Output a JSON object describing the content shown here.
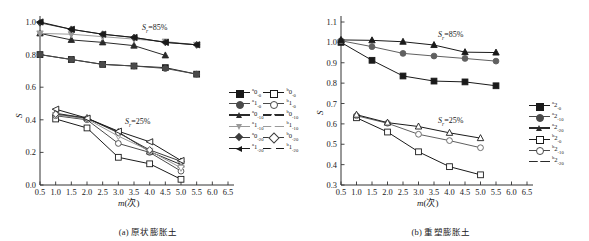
{
  "figure": {
    "panels": [
      {
        "id": "a",
        "caption": "(a) 原状膨胀土",
        "xlabel": "m(次)",
        "ylabel": "S",
        "annotations": [
          {
            "name": "sr-85-label",
            "text": "S",
            "sub": "r",
            "rest": "=85%"
          },
          {
            "name": "sr-25-label",
            "text": "S",
            "sub": "r",
            "rest": "=25%"
          }
        ]
      },
      {
        "id": "b",
        "caption": "(b) 重塑膨胀土",
        "xlabel": "m(次)",
        "ylabel": "S",
        "annotations": [
          {
            "name": "sr-85-label",
            "text": "S",
            "sub": "r",
            "rest": "=85%"
          },
          {
            "name": "sr-25-label",
            "text": "S",
            "sub": "r",
            "rest": "=25%"
          }
        ]
      }
    ]
  },
  "chart_data": [
    {
      "type": "line",
      "panel": "a",
      "title": "(a) 原状膨胀土",
      "xlabel": "m(次)",
      "ylabel": "S",
      "xlim": [
        0.5,
        6.5
      ],
      "ylim": [
        0.0,
        1.0
      ],
      "xticks": [
        0.5,
        1.0,
        1.5,
        2.0,
        2.5,
        3.0,
        3.5,
        4.0,
        4.5,
        5.0,
        5.5,
        6.0,
        6.5
      ],
      "yticks": [
        0.0,
        0.2,
        0.4,
        0.6,
        0.8,
        1.0
      ],
      "xtick_labels": [
        "0.5",
        "1.0",
        "1.5",
        "2.0",
        "2.5",
        "3.0",
        "3.5",
        "4.0",
        "4.5",
        "5.0",
        "5.5",
        "6.0",
        "6.5"
      ],
      "ytick_labels": [
        "0.0",
        "0.2",
        "0.4",
        "0.6",
        "0.8",
        "1.0"
      ],
      "grid": false,
      "legend_position": "right",
      "groups": [
        {
          "name": "Sr=85%",
          "label_sub": "r",
          "value": "85%"
        },
        {
          "name": "Sr=25%",
          "label_sub": "r",
          "value": "25%"
        }
      ],
      "series": [
        {
          "name": "a0-0",
          "sup": "a",
          "base": "0",
          "sub": "-0",
          "group": "Sr=85%",
          "marker": "square-filled",
          "color": "#1a1a1a",
          "x": [
            0.5,
            1.5,
            2.5,
            3.5,
            4.5,
            5.5
          ],
          "y": [
            0.8,
            0.77,
            0.74,
            0.73,
            0.72,
            0.68
          ]
        },
        {
          "name": "a1-0",
          "sup": "a",
          "base": "1",
          "sub": "-0",
          "group": "Sr=85%",
          "marker": "circle-filled",
          "color": "#4a4a4a",
          "x": [
            0.5,
            1.5,
            2.5,
            3.5,
            4.5,
            5.5
          ],
          "y": [
            0.8,
            0.77,
            0.74,
            0.73,
            0.715,
            0.68
          ]
        },
        {
          "name": "a0-10",
          "sup": "a",
          "base": "0",
          "sub": "-10",
          "group": "Sr=85%",
          "marker": "triangle-filled",
          "color": "#2a2a2a",
          "x": [
            0.5,
            1.5,
            2.5,
            3.5,
            4.5
          ],
          "y": [
            0.93,
            0.89,
            0.875,
            0.855,
            0.795
          ]
        },
        {
          "name": "a1-10",
          "sup": "a",
          "base": "1",
          "sub": "-10",
          "group": "Sr=85%",
          "marker": "triangle-down",
          "color": "#9a9a9a",
          "x": [
            0.5,
            1.5,
            2.5,
            3.5,
            4.5,
            5.5
          ],
          "y": [
            0.93,
            0.925,
            0.91,
            0.895,
            0.88,
            0.86
          ]
        },
        {
          "name": "a0-20",
          "sup": "a",
          "base": "0",
          "sub": "-20",
          "group": "Sr=85%",
          "marker": "diamond-filled",
          "color": "#3c3c3c",
          "x": [
            0.5,
            1.5,
            2.5,
            3.5,
            4.5,
            5.5
          ],
          "y": [
            0.995,
            0.955,
            0.925,
            0.905,
            0.875,
            0.86
          ]
        },
        {
          "name": "a1-20",
          "sup": "a",
          "base": "1",
          "sub": "-20",
          "group": "Sr=85%",
          "marker": "left-triangle-filled",
          "color": "#1a1a1a",
          "x": [
            0.5,
            1.5,
            2.5,
            3.5,
            4.5,
            5.5
          ],
          "y": [
            1.0,
            0.955,
            0.925,
            0.905,
            0.875,
            0.86
          ]
        },
        {
          "name": "b0-0",
          "sup": "b",
          "base": "0",
          "sub": "-0",
          "group": "Sr=25%",
          "marker": "square-open",
          "color": "#1a1a1a",
          "x": [
            1.0,
            2.0,
            3.0,
            4.0,
            5.0
          ],
          "y": [
            0.405,
            0.35,
            0.17,
            0.13,
            0.035
          ]
        },
        {
          "name": "b1-0",
          "sup": "b",
          "base": "1",
          "sub": "-0",
          "group": "Sr=25%",
          "marker": "circle-open",
          "color": "#4a4a4a",
          "x": [
            1.0,
            2.0,
            3.0,
            4.0,
            5.0
          ],
          "y": [
            0.425,
            0.4,
            0.255,
            0.2,
            0.085
          ]
        },
        {
          "name": "b0-10",
          "sup": "b",
          "base": "0",
          "sub": "-10",
          "group": "Sr=25%",
          "marker": "triangle-open",
          "color": "#2a2a2a",
          "x": [
            1.0,
            2.0,
            3.0,
            4.0,
            5.0
          ],
          "y": [
            0.44,
            0.41,
            0.325,
            0.205,
            0.125
          ]
        },
        {
          "name": "b1-10",
          "sup": "b",
          "base": "1",
          "sub": "-10",
          "group": "Sr=25%",
          "marker": "triangle-down-open",
          "color": "#9a9a9a",
          "x": [
            1.0,
            2.0,
            3.0,
            4.0,
            5.0
          ],
          "y": [
            0.43,
            0.405,
            0.3,
            0.21,
            0.105
          ]
        },
        {
          "name": "b0-20",
          "sup": "b",
          "base": "0",
          "sub": "-20",
          "group": "Sr=25%",
          "marker": "diamond-open",
          "color": "#3c3c3c",
          "x": [
            1.0,
            2.0,
            3.0,
            4.0,
            5.0
          ],
          "y": [
            0.435,
            0.41,
            0.32,
            0.215,
            0.145
          ]
        },
        {
          "name": "b1-20",
          "sup": "b",
          "base": "1",
          "sub": "-20",
          "group": "Sr=25%",
          "marker": "left-triangle-open",
          "color": "#1a1a1a",
          "x": [
            1.0,
            2.0,
            3.0,
            4.0,
            5.0
          ],
          "y": [
            0.465,
            0.41,
            0.33,
            0.265,
            0.15
          ]
        }
      ],
      "legend": [
        {
          "sup": "a",
          "base": "0",
          "sub": "-0",
          "marker": "square-filled"
        },
        {
          "sup": "b",
          "base": "0",
          "sub": "-0",
          "marker": "square-open"
        },
        {
          "sup": "a",
          "base": "1",
          "sub": "-0",
          "marker": "circle-filled"
        },
        {
          "sup": "b",
          "base": "1",
          "sub": "-0",
          "marker": "circle-open"
        },
        {
          "sup": "a",
          "base": "0",
          "sub": "-10",
          "marker": "triangle-filled"
        },
        {
          "sup": "b",
          "base": "0",
          "sub": "-10",
          "marker": "triangle-open"
        },
        {
          "sup": "a",
          "base": "1",
          "sub": "-10",
          "marker": "triangle-down"
        },
        {
          "sup": "b",
          "base": "1",
          "sub": "-10",
          "marker": "triangle-down-open"
        },
        {
          "sup": "a",
          "base": "0",
          "sub": "-20",
          "marker": "diamond-filled"
        },
        {
          "sup": "b",
          "base": "0",
          "sub": "-20",
          "marker": "diamond-open"
        },
        {
          "sup": "a",
          "base": "1",
          "sub": "-20",
          "marker": "left-triangle-filled"
        },
        {
          "sup": "b",
          "base": "1",
          "sub": "-20",
          "marker": "left-triangle-open"
        }
      ]
    },
    {
      "type": "line",
      "panel": "b",
      "title": "(b) 重塑膨胀土",
      "xlabel": "m(次)",
      "ylabel": "S",
      "xlim": [
        0.5,
        6.5
      ],
      "ylim": [
        0.3,
        1.1
      ],
      "xticks": [
        0.5,
        1.0,
        1.5,
        2.0,
        2.5,
        3.0,
        3.5,
        4.0,
        4.5,
        5.0,
        5.5,
        6.0,
        6.5
      ],
      "yticks": [
        0.3,
        0.4,
        0.5,
        0.6,
        0.7,
        0.8,
        0.9,
        1.0,
        1.1
      ],
      "xtick_labels": [
        "0.5",
        "1.0",
        "1.5",
        "2.0",
        "2.5",
        "3.0",
        "3.5",
        "4.0",
        "4.5",
        "5.0",
        "5.5",
        "6.0",
        "6.5"
      ],
      "ytick_labels": [
        "0.3",
        "0.4",
        "0.5",
        "0.6",
        "0.7",
        "0.8",
        "0.9",
        "1.0",
        "1.1"
      ],
      "grid": false,
      "legend_position": "right",
      "groups": [
        {
          "name": "Sr=85%",
          "label_sub": "r",
          "value": "85%"
        },
        {
          "name": "Sr=25%",
          "label_sub": "r",
          "value": "25%"
        }
      ],
      "series": [
        {
          "name": "a2-0",
          "sup": "a",
          "base": "2",
          "sub": "-0",
          "group": "Sr=85%",
          "marker": "square-filled",
          "color": "#1a1a1a",
          "x": [
            0.5,
            1.5,
            2.5,
            3.5,
            4.5,
            5.5
          ],
          "y": [
            1.0,
            0.912,
            0.835,
            0.81,
            0.806,
            0.787
          ]
        },
        {
          "name": "a2-10",
          "sup": "a",
          "base": "2",
          "sub": "-10",
          "group": "Sr=85%",
          "marker": "circle-filled",
          "color": "#606060",
          "x": [
            0.5,
            1.5,
            2.5,
            3.5,
            4.5,
            5.5
          ],
          "y": [
            1.008,
            0.979,
            0.946,
            0.933,
            0.921,
            0.908
          ]
        },
        {
          "name": "a2-20",
          "sup": "a",
          "base": "2",
          "sub": "-20",
          "group": "Sr=85%",
          "marker": "triangle-filled",
          "color": "#1a1a1a",
          "x": [
            0.5,
            1.5,
            2.5,
            3.5,
            4.5,
            5.5
          ],
          "y": [
            1.012,
            1.01,
            1.003,
            0.987,
            0.952,
            0.95
          ]
        },
        {
          "name": "b2-0",
          "sup": "b",
          "base": "2",
          "sub": "-0",
          "group": "Sr=25%",
          "marker": "square-open",
          "color": "#1a1a1a",
          "x": [
            1.0,
            2.0,
            3.0,
            4.0,
            5.0
          ],
          "y": [
            0.63,
            0.56,
            0.463,
            0.39,
            0.35
          ]
        },
        {
          "name": "b2-10",
          "sup": "b",
          "base": "2",
          "sub": "-10",
          "group": "Sr=25%",
          "marker": "circle-open",
          "color": "#606060",
          "x": [
            1.0,
            2.0,
            3.0,
            4.0,
            5.0
          ],
          "y": [
            0.64,
            0.603,
            0.549,
            0.518,
            0.483
          ]
        },
        {
          "name": "b2-20",
          "sup": "b",
          "base": "2",
          "sub": "-20",
          "group": "Sr=25%",
          "marker": "triangle-open",
          "color": "#1a1a1a",
          "x": [
            1.0,
            2.0,
            3.0,
            4.0,
            5.0
          ],
          "y": [
            0.645,
            0.606,
            0.587,
            0.556,
            0.53
          ]
        }
      ],
      "legend": [
        {
          "sup": "a",
          "base": "2",
          "sub": "-0",
          "marker": "square-filled"
        },
        {
          "sup": "a",
          "base": "2",
          "sub": "-10",
          "marker": "circle-filled"
        },
        {
          "sup": "a",
          "base": "2",
          "sub": "-20",
          "marker": "triangle-filled"
        },
        {
          "sup": "b",
          "base": "2",
          "sub": "-0",
          "marker": "square-open"
        },
        {
          "sup": "b",
          "base": "2",
          "sub": "-10",
          "marker": "circle-open"
        },
        {
          "sup": "b",
          "base": "2",
          "sub": "-20",
          "marker": "triangle-open"
        }
      ]
    }
  ]
}
